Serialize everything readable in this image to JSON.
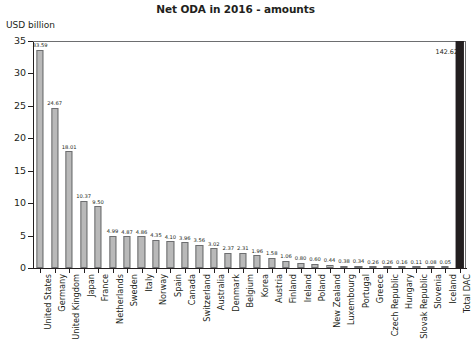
{
  "chart_data": {
    "type": "bar",
    "title": "Net ODA in 2016 - amounts",
    "xlabel": "",
    "ylabel": "USD billion",
    "ylim": [
      0,
      35
    ],
    "yticks": [
      0,
      5,
      10,
      15,
      20,
      25,
      30,
      35
    ],
    "grid": false,
    "legend": "none",
    "categories": [
      "United States",
      "Germany",
      "United Kingdom",
      "Japan",
      "France",
      "Netherlands",
      "Sweden",
      "Italy",
      "Norway",
      "Spain",
      "Canada",
      "Switzerland",
      "Australia",
      "Denmark",
      "Belgium",
      "Korea",
      "Austria",
      "Finland",
      "Ireland",
      "Poland",
      "New Zealand",
      "Luxembourg",
      "Portugal",
      "Greece",
      "Czech Republic",
      "Hungary",
      "Slovak Republic",
      "Slovenia",
      "Iceland",
      "Total DAC"
    ],
    "values": [
      33.59,
      24.67,
      18.01,
      10.37,
      9.5,
      4.99,
      4.87,
      4.86,
      4.35,
      4.1,
      3.96,
      3.56,
      3.02,
      2.37,
      2.31,
      1.96,
      1.58,
      1.06,
      0.8,
      0.6,
      0.44,
      0.38,
      0.34,
      0.26,
      0.26,
      0.16,
      0.11,
      0.08,
      0.05,
      142.62
    ],
    "value_labels": [
      "33.59",
      "24.67",
      "18.01",
      "10.37",
      "9.50",
      "4.99",
      "4.87",
      "4.86",
      "4.35",
      "4.10",
      "3.96",
      "3.56",
      "3.02",
      "2.37",
      "2.31",
      "1.96",
      "1.58",
      "1.06",
      "0.80",
      "0.60",
      "0.44",
      "0.38",
      "0.34",
      "0.26",
      "0.26",
      "0.16",
      "0.11",
      "0.08",
      "0.05",
      "142.62"
    ],
    "ytick_labels": [
      "0",
      "5",
      "10",
      "15",
      "20",
      "25",
      "30",
      "35"
    ],
    "series_colors": {
      "bar_fill": "#b9b9b9",
      "bar_border": "#6d6e70",
      "total_bar_fill": "#231f20",
      "axis": "#231f20",
      "text": "#231f20"
    },
    "notes": {
      "total_bar_clipped": "Total DAC value 142.62 exceeds the 35 axis maximum; bar is drawn clipped at the top of the plot area."
    }
  }
}
